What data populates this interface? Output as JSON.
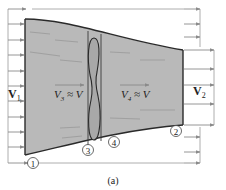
{
  "figure": {
    "caption": "(a)",
    "colors": {
      "stream_fill": "#b9b9b9",
      "wall": "#2a2a2a",
      "arrow": "#8a8a8a",
      "streak": "#9a9a9a",
      "background": "#ffffff"
    },
    "labels": {
      "v1_main": "V",
      "v1_sub": "1",
      "v2_main": "V",
      "v2_sub": "2",
      "v3_main": "V",
      "v3_sub": "3",
      "v3_rest": " ≈ V",
      "v4_main": "V",
      "v4_sub": "4",
      "v4_rest": " ≈ V"
    },
    "stations": [
      {
        "id": "1",
        "label": "1"
      },
      {
        "id": "2",
        "label": "2"
      },
      {
        "id": "3",
        "label": "3"
      },
      {
        "id": "4",
        "label": "4"
      }
    ]
  }
}
